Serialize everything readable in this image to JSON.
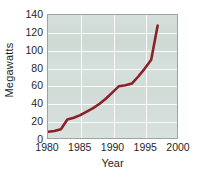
{
  "chart_data": {
    "type": "line",
    "title": "",
    "subtitle": "",
    "xlabel": "Year",
    "ylabel": "Megawatts",
    "xlim": [
      1980,
      2000
    ],
    "ylim": [
      0,
      140
    ],
    "grid": true,
    "legend": null,
    "legend_position": "none",
    "line_color": "#8B2026",
    "plot_background_color": "#ccd7d2",
    "gridline_color": "#ffffff",
    "x_ticks": [
      1980,
      1985,
      1990,
      1995,
      2000
    ],
    "x_tick_labels": [
      "1980",
      "1985",
      "1990",
      "1995",
      "2000"
    ],
    "y_ticks": [
      0,
      20,
      40,
      60,
      80,
      100,
      120,
      140
    ],
    "y_tick_labels": [
      "0",
      "20",
      "40",
      "60",
      "80",
      "100",
      "120",
      "140"
    ],
    "series": [
      {
        "name": "Megawatts",
        "x": [
          1980,
          1981,
          1982,
          1983,
          1984,
          1985,
          1986,
          1987,
          1988,
          1989,
          1990,
          1991,
          1992,
          1993,
          1994,
          1995,
          1996,
          1997
        ],
        "values": [
          7,
          8,
          10,
          21,
          23,
          26,
          30,
          34,
          39,
          45,
          52,
          59,
          60,
          62,
          70,
          79,
          89,
          128
        ]
      }
    ],
    "annotations": []
  },
  "axes": {
    "y_title": "Megawatts",
    "x_title": "Year"
  }
}
